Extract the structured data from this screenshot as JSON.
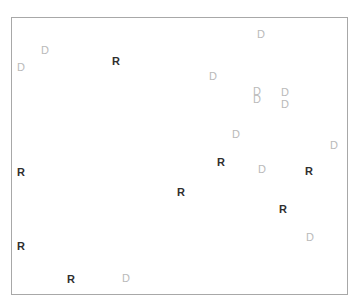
{
  "chart_data": {
    "type": "scatter",
    "title": "",
    "subtitle": "",
    "xlabel": "",
    "ylabel": "",
    "grid": false,
    "legend": "none",
    "axis_ticks": [],
    "tick_labels": [],
    "frame": {
      "left": 11,
      "top": 17,
      "width": 337,
      "height": 278,
      "border_color": "#a8a8a8",
      "background": "#ffffff"
    },
    "xlim": [
      11,
      348
    ],
    "ylim": [
      17,
      295
    ],
    "series": [
      {
        "name": "R",
        "label": "R",
        "color": "#2f2f2f",
        "marker_text": "R",
        "bold": true,
        "count": 9,
        "points": [
          {
            "label": "R",
            "x": 116,
            "y": 61
          },
          {
            "label": "R",
            "x": 21,
            "y": 172
          },
          {
            "label": "R",
            "x": 221,
            "y": 162
          },
          {
            "label": "R",
            "x": 309,
            "y": 171
          },
          {
            "label": "R",
            "x": 181,
            "y": 192
          },
          {
            "label": "R",
            "x": 283,
            "y": 209
          },
          {
            "label": "R",
            "x": 21,
            "y": 246
          },
          {
            "label": "R",
            "x": 71,
            "y": 279
          }
        ]
      },
      {
        "name": "D",
        "label": "D",
        "color": "#b9b9b9",
        "marker_text": "D",
        "bold": false,
        "count": 14,
        "points": [
          {
            "label": "D",
            "x": 261,
            "y": 34
          },
          {
            "label": "D",
            "x": 45,
            "y": 50
          },
          {
            "label": "D",
            "x": 21,
            "y": 67
          },
          {
            "label": "D",
            "x": 213,
            "y": 76
          },
          {
            "label": "D",
            "x": 257,
            "y": 91
          },
          {
            "label": "D",
            "x": 257,
            "y": 99
          },
          {
            "label": "D",
            "x": 285,
            "y": 92
          },
          {
            "label": "D",
            "x": 285,
            "y": 104
          },
          {
            "label": "D",
            "x": 236,
            "y": 134
          },
          {
            "label": "D",
            "x": 334,
            "y": 145
          },
          {
            "label": "D",
            "x": 262,
            "y": 169
          },
          {
            "label": "D",
            "x": 310,
            "y": 237
          },
          {
            "label": "D",
            "x": 126,
            "y": 278
          }
        ]
      }
    ]
  }
}
